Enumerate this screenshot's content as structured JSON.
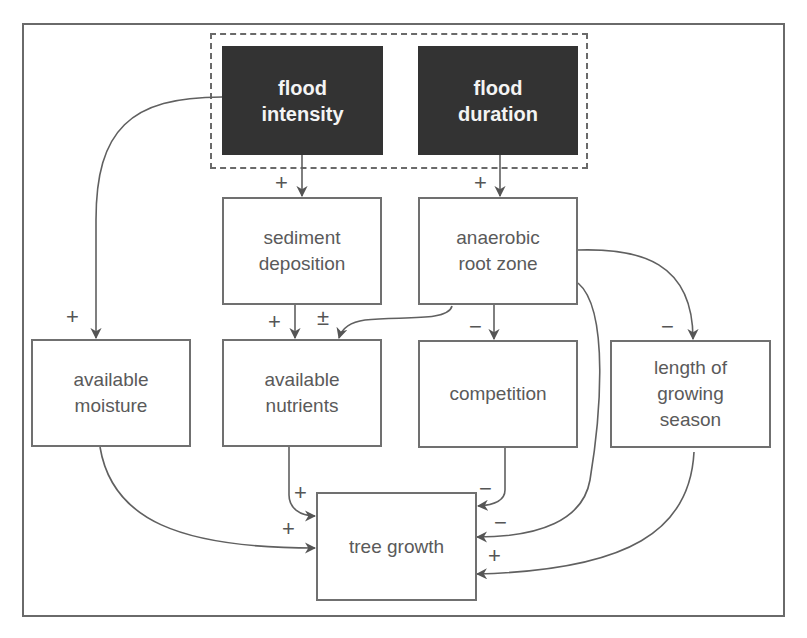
{
  "diagram": {
    "type": "causal-loop-diagram",
    "group": {
      "label": "",
      "style": "dashed",
      "contains": [
        "flood_intensity",
        "flood_duration"
      ]
    },
    "nodes": {
      "flood_intensity": {
        "label": "flood\nintensity",
        "style": "dark"
      },
      "flood_duration": {
        "label": "flood\nduration",
        "style": "dark"
      },
      "sediment_deposition": {
        "label": "sediment\ndeposition"
      },
      "anaerobic_root_zone": {
        "label": "anaerobic\nroot zone"
      },
      "available_moisture": {
        "label": "available\nmoisture"
      },
      "available_nutrients": {
        "label": "available\nnutrients"
      },
      "competition": {
        "label": "competition"
      },
      "length_of_growing_season": {
        "label": "length of\ngrowing\nseason"
      },
      "tree_growth": {
        "label": "tree growth"
      }
    },
    "edges": [
      {
        "from": "flood_intensity",
        "to": "sediment_deposition",
        "sign": "+"
      },
      {
        "from": "flood_intensity",
        "to": "available_moisture",
        "sign": "+"
      },
      {
        "from": "flood_duration",
        "to": "anaerobic_root_zone",
        "sign": "+"
      },
      {
        "from": "sediment_deposition",
        "to": "available_nutrients",
        "sign": "+"
      },
      {
        "from": "anaerobic_root_zone",
        "to": "available_nutrients",
        "sign": "±"
      },
      {
        "from": "anaerobic_root_zone",
        "to": "competition",
        "sign": "−"
      },
      {
        "from": "anaerobic_root_zone",
        "to": "length_of_growing_season",
        "sign": "−"
      },
      {
        "from": "anaerobic_root_zone",
        "to": "tree_growth",
        "sign": "−"
      },
      {
        "from": "available_moisture",
        "to": "tree_growth",
        "sign": "+"
      },
      {
        "from": "available_nutrients",
        "to": "tree_growth",
        "sign": "+"
      },
      {
        "from": "competition",
        "to": "tree_growth",
        "sign": "−"
      },
      {
        "from": "length_of_growing_season",
        "to": "tree_growth",
        "sign": "+"
      }
    ]
  }
}
